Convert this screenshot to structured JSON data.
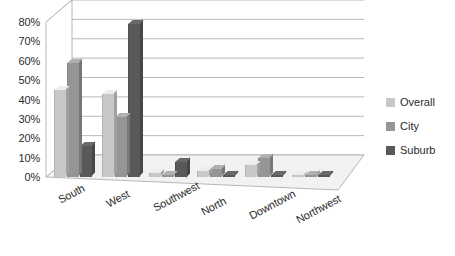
{
  "chart_data": {
    "type": "bar",
    "title": "",
    "subtitle": "",
    "xlabel": "",
    "ylabel": "",
    "categories": [
      "South",
      "West",
      "Southwest",
      "North",
      "Downtown",
      "Northwest"
    ],
    "series": [
      {
        "name": "Overall",
        "color": "#c8c8c8",
        "values": [
          45,
          43,
          2,
          3,
          6,
          1
        ]
      },
      {
        "name": "City",
        "color": "#959595",
        "values": [
          59,
          31,
          1,
          4,
          10,
          1
        ]
      },
      {
        "name": "Suburb",
        "color": "#595959",
        "values": [
          16,
          79,
          8,
          1,
          1,
          1
        ]
      }
    ],
    "ylim": [
      0,
      80
    ],
    "ytick_values": [
      0,
      10,
      20,
      30,
      40,
      50,
      60,
      70,
      80
    ],
    "ytick_labels": [
      "0%",
      "10%",
      "20%",
      "30%",
      "40%",
      "50%",
      "60%",
      "70%",
      "80%"
    ],
    "grid": true,
    "grid_axis": "y",
    "legend_position": "right",
    "style": "3d-column",
    "plot_bgcolor": "#ffffff",
    "grid_color": "#a6a6a6",
    "text_color": "#2b2b2b",
    "xtick_rotation": -28
  },
  "legend": {
    "items": [
      {
        "label": "Overall",
        "color": "#c8c8c8"
      },
      {
        "label": "City",
        "color": "#959595"
      },
      {
        "label": "Suburb",
        "color": "#595959"
      }
    ]
  }
}
